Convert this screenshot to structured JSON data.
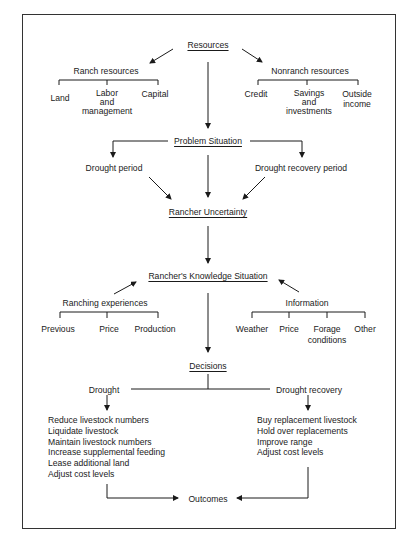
{
  "diagram": {
    "root": "Resources",
    "ranch_resources": {
      "label": "Ranch resources",
      "items": [
        "Land",
        "Labor\nand\nmanagement",
        "Capital"
      ]
    },
    "nonranch_resources": {
      "label": "Nonranch resources",
      "items": [
        "Credit",
        "Savings\nand\ninvestments",
        "Outside\nincome"
      ]
    },
    "problem_situation": "Problem Situation",
    "drought_period": "Drought period",
    "drought_recovery_period": "Drought recovery period",
    "rancher_uncertainty": "Rancher Uncertainty",
    "knowledge_situation": "Rancher's Knowledge Situation",
    "ranching_experiences": {
      "label": "Ranching experiences",
      "items": [
        "Previous",
        "Price",
        "Production"
      ]
    },
    "information": {
      "label": "Information",
      "items": [
        "Weather",
        "Price",
        "Forage\nconditions",
        "Other"
      ]
    },
    "decisions": "Decisions",
    "drought": {
      "label": "Drought",
      "actions": [
        "Reduce livestock numbers",
        "Liquidate livestock",
        "Maintain livestock numbers",
        "Increase supplemental feeding",
        "Lease additional land",
        "Adjust cost levels"
      ]
    },
    "drought_recovery": {
      "label": "Drought recovery",
      "actions": [
        "Buy replacement livestock",
        "Hold over replacements",
        "Improve range",
        "Adjust cost levels"
      ]
    },
    "outcomes": "Outcomes"
  },
  "colors": {
    "line": "#1a1a1a",
    "frame": "#333333",
    "background": "#ffffff"
  }
}
